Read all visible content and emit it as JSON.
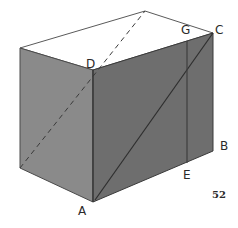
{
  "figure": {
    "number": "52",
    "colors": {
      "background": "#ffffff",
      "top_face": "#ffffff",
      "left_face": "#8a8a8a",
      "front_face": "#6e6e6e",
      "edge": "#3a3a3a",
      "label": "#2a2a2a"
    },
    "vertices": {
      "top_left_front": [
        20,
        48
      ],
      "top_back": [
        145,
        11
      ],
      "C": [
        213,
        33
      ],
      "D": [
        93,
        70
      ],
      "bottom_left": [
        20,
        168
      ],
      "A": [
        93,
        202
      ],
      "B": [
        213,
        151
      ],
      "G": [
        187,
        41
      ],
      "E": [
        187,
        163
      ]
    },
    "labels": [
      {
        "text": "D",
        "x": 86,
        "y": 68
      },
      {
        "text": "G",
        "x": 181,
        "y": 34
      },
      {
        "text": "C",
        "x": 215,
        "y": 34
      },
      {
        "text": "B",
        "x": 220,
        "y": 150
      },
      {
        "text": "E",
        "x": 183,
        "y": 179
      },
      {
        "text": "A",
        "x": 78,
        "y": 215
      }
    ],
    "lines": {
      "solid_diagonal": "A-C",
      "vertical_segment": "G-E",
      "dashed_hidden_diagonal": "bottom_left-top_back"
    }
  }
}
